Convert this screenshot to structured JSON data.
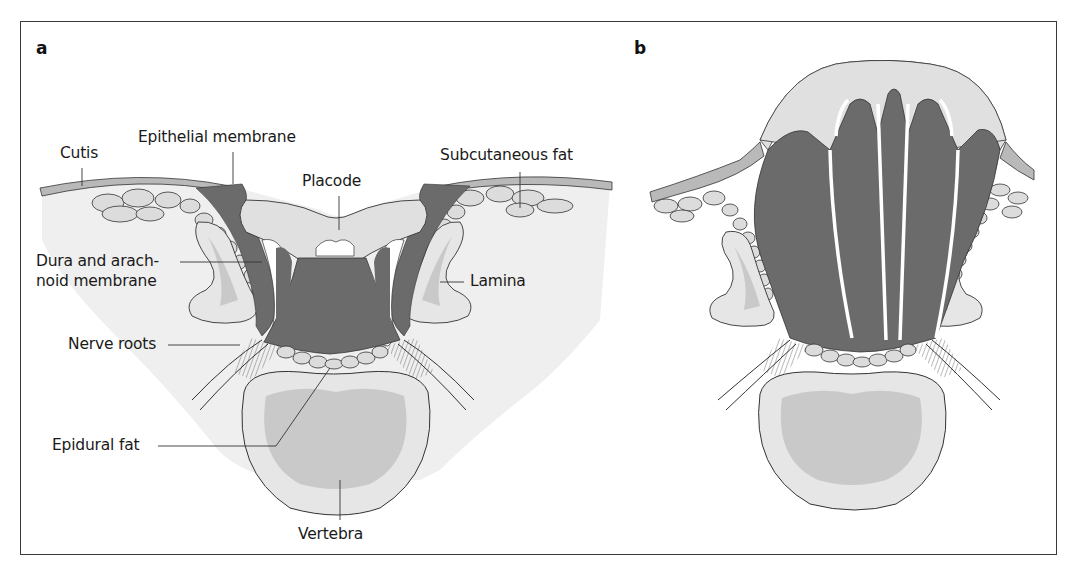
{
  "figure": {
    "panels": [
      {
        "id": "a",
        "letter": "a",
        "labels": {
          "cutis": "Cutis",
          "epithelial_membrane": "Epithelial membrane",
          "placode": "Placode",
          "subcutaneous_fat": "Subcutaneous fat",
          "dura_line1": "Dura and arach-",
          "dura_line2": "noid membrane",
          "lamina": "Lamina",
          "nerve_roots": "Nerve roots",
          "epidural_fat": "Epidural fat",
          "vertebra": "Vertebra"
        }
      },
      {
        "id": "b",
        "letter": "b",
        "labels": {}
      }
    ],
    "colors": {
      "neural_tissue": "#6b6b6b",
      "skin": "#b9b9b9",
      "soft_tissue": "#ececec",
      "bone_outer": "#e4e4e4",
      "bone_inner": "#c9c9c9",
      "fat": "#d6d6d6",
      "outline": "#2a2a2a",
      "csf": "#ffffff"
    }
  }
}
